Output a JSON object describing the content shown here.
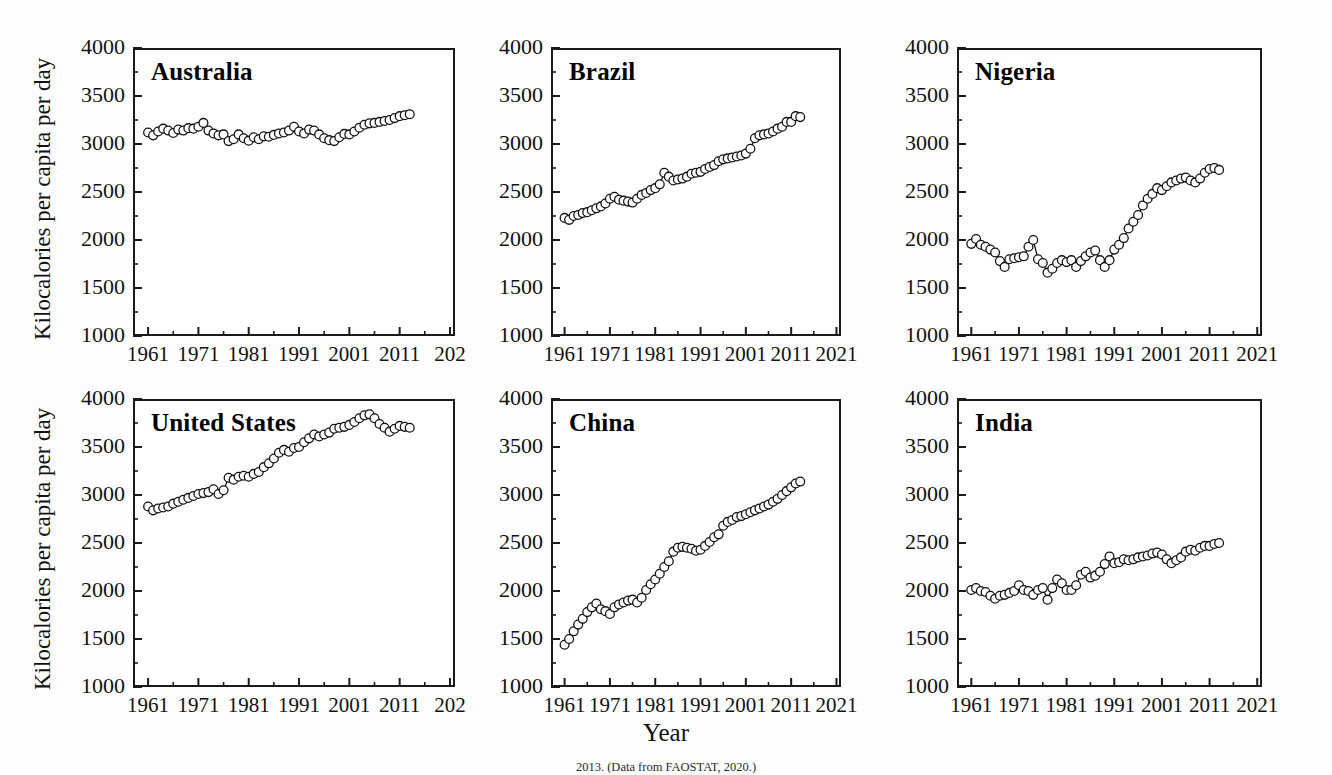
{
  "figure": {
    "xlabel": "Year",
    "ylabel": "Kilocalories per capita per day",
    "caption": "2013. (Data from FAOSTAT, 2020.)",
    "marker": "open-circle",
    "line_color": "#111111",
    "marker_fill": "#ffffff",
    "marker_stroke": "#111111"
  },
  "axes": {
    "ylim": [
      1000,
      4000
    ],
    "yticks": [
      1000,
      1500,
      2000,
      2500,
      3000,
      3500,
      4000
    ],
    "ytick_labels": [
      "1000",
      "1500",
      "2000",
      "2500",
      "3000",
      "3500",
      "4000"
    ],
    "yminor_step": 250,
    "xlim": [
      1958,
      2022
    ],
    "xticks": [
      1961,
      1971,
      1981,
      1991,
      2001,
      2011,
      2021
    ],
    "xtick_labels": [
      "1961",
      "1971",
      "1981",
      "1991",
      "2001",
      "2011",
      "2021"
    ],
    "xtick_labels_clipped": [
      "1961",
      "1971",
      "1981",
      "1991",
      "2001",
      "2011",
      "202"
    ],
    "xminor_step": 5,
    "grid": false,
    "legend": "none"
  },
  "chart_data": {
    "type": "line",
    "title": "",
    "xlabel": "Year",
    "ylabel": "Kilocalories per capita per day",
    "ylim": [
      1000,
      4000
    ],
    "xlim": [
      1958,
      2022
    ],
    "x": [
      1961,
      1962,
      1963,
      1964,
      1965,
      1966,
      1967,
      1968,
      1969,
      1970,
      1971,
      1972,
      1973,
      1974,
      1975,
      1976,
      1977,
      1978,
      1979,
      1980,
      1981,
      1982,
      1983,
      1984,
      1985,
      1986,
      1987,
      1988,
      1989,
      1990,
      1991,
      1992,
      1993,
      1994,
      1995,
      1996,
      1997,
      1998,
      1999,
      2000,
      2001,
      2002,
      2003,
      2004,
      2005,
      2006,
      2007,
      2008,
      2009,
      2010,
      2011,
      2012,
      2013
    ],
    "series": [
      {
        "name": "Australia",
        "values": [
          3120,
          3090,
          3130,
          3160,
          3140,
          3115,
          3150,
          3140,
          3165,
          3160,
          3180,
          3220,
          3140,
          3110,
          3090,
          3100,
          3030,
          3050,
          3100,
          3060,
          3035,
          3070,
          3050,
          3080,
          3075,
          3095,
          3110,
          3120,
          3140,
          3180,
          3130,
          3110,
          3150,
          3140,
          3100,
          3060,
          3040,
          3030,
          3070,
          3105,
          3100,
          3130,
          3170,
          3200,
          3215,
          3220,
          3230,
          3240,
          3250,
          3270,
          3290,
          3300,
          3310
        ]
      },
      {
        "name": "Brazil",
        "values": [
          2230,
          2210,
          2250,
          2260,
          2280,
          2290,
          2310,
          2330,
          2350,
          2380,
          2430,
          2450,
          2420,
          2410,
          2400,
          2390,
          2430,
          2470,
          2490,
          2520,
          2540,
          2580,
          2700,
          2660,
          2620,
          2630,
          2640,
          2660,
          2690,
          2700,
          2710,
          2740,
          2760,
          2780,
          2820,
          2840,
          2850,
          2860,
          2870,
          2880,
          2900,
          2950,
          3060,
          3090,
          3100,
          3110,
          3130,
          3160,
          3180,
          3230,
          3230,
          3290,
          3280
        ]
      },
      {
        "name": "Nigeria",
        "values": [
          1960,
          2010,
          1950,
          1930,
          1900,
          1870,
          1780,
          1720,
          1800,
          1810,
          1820,
          1830,
          1930,
          2000,
          1800,
          1760,
          1660,
          1700,
          1760,
          1790,
          1770,
          1790,
          1720,
          1780,
          1830,
          1870,
          1890,
          1790,
          1720,
          1790,
          1900,
          1950,
          2020,
          2120,
          2190,
          2260,
          2360,
          2430,
          2480,
          2540,
          2520,
          2560,
          2600,
          2620,
          2640,
          2650,
          2620,
          2600,
          2640,
          2700,
          2740,
          2750,
          2730
        ]
      },
      {
        "name": "United States",
        "values": [
          2880,
          2840,
          2860,
          2870,
          2880,
          2910,
          2930,
          2950,
          2970,
          2990,
          3010,
          3020,
          3030,
          3060,
          3010,
          3050,
          3180,
          3160,
          3190,
          3200,
          3190,
          3220,
          3240,
          3290,
          3330,
          3380,
          3440,
          3470,
          3450,
          3490,
          3500,
          3550,
          3590,
          3630,
          3610,
          3630,
          3650,
          3690,
          3700,
          3710,
          3730,
          3760,
          3800,
          3830,
          3840,
          3800,
          3740,
          3700,
          3660,
          3690,
          3720,
          3710,
          3700
        ]
      },
      {
        "name": "China",
        "values": [
          1440,
          1500,
          1580,
          1650,
          1710,
          1780,
          1830,
          1870,
          1810,
          1790,
          1760,
          1830,
          1860,
          1880,
          1900,
          1910,
          1880,
          1930,
          2010,
          2070,
          2120,
          2180,
          2250,
          2310,
          2410,
          2450,
          2460,
          2450,
          2440,
          2420,
          2430,
          2470,
          2510,
          2560,
          2590,
          2680,
          2720,
          2740,
          2770,
          2780,
          2800,
          2820,
          2840,
          2860,
          2880,
          2900,
          2930,
          2960,
          3000,
          3040,
          3080,
          3120,
          3140
        ]
      },
      {
        "name": "India",
        "values": [
          2010,
          2030,
          2000,
          1990,
          1950,
          1920,
          1950,
          1960,
          1980,
          2000,
          2060,
          2010,
          2000,
          1960,
          2010,
          2030,
          1910,
          2030,
          2120,
          2080,
          2010,
          2010,
          2060,
          2170,
          2200,
          2140,
          2160,
          2200,
          2280,
          2360,
          2290,
          2300,
          2330,
          2320,
          2330,
          2350,
          2360,
          2370,
          2390,
          2400,
          2380,
          2330,
          2290,
          2320,
          2350,
          2410,
          2430,
          2420,
          2450,
          2470,
          2470,
          2490,
          2500
        ]
      }
    ]
  },
  "panels": [
    {
      "id": "australia",
      "title": "Australia",
      "series": "Australia",
      "row": 0,
      "col": 0,
      "show_ylabel": true,
      "xlabels_clipped": true
    },
    {
      "id": "brazil",
      "title": "Brazil",
      "series": "Brazil",
      "row": 0,
      "col": 1,
      "show_ylabel": false,
      "xlabels_clipped": false
    },
    {
      "id": "nigeria",
      "title": "Nigeria",
      "series": "Nigeria",
      "row": 0,
      "col": 2,
      "show_ylabel": false,
      "xlabels_clipped": false
    },
    {
      "id": "united-states",
      "title": "United States",
      "series": "United States",
      "row": 1,
      "col": 0,
      "show_ylabel": true,
      "xlabels_clipped": true
    },
    {
      "id": "china",
      "title": "China",
      "series": "China",
      "row": 1,
      "col": 1,
      "show_ylabel": false,
      "xlabels_clipped": false
    },
    {
      "id": "india",
      "title": "India",
      "series": "India",
      "row": 1,
      "col": 2,
      "show_ylabel": false,
      "xlabels_clipped": false
    }
  ],
  "layout": {
    "panel_frames": [
      {
        "x": 133,
        "y": 48,
        "w": 322,
        "h": 288
      },
      {
        "x": 551,
        "y": 48,
        "w": 290,
        "h": 288
      },
      {
        "x": 957,
        "y": 48,
        "w": 305,
        "h": 288
      },
      {
        "x": 133,
        "y": 399,
        "w": 322,
        "h": 288
      },
      {
        "x": 551,
        "y": 399,
        "w": 290,
        "h": 288
      },
      {
        "x": 957,
        "y": 399,
        "w": 305,
        "h": 288
      }
    ]
  }
}
